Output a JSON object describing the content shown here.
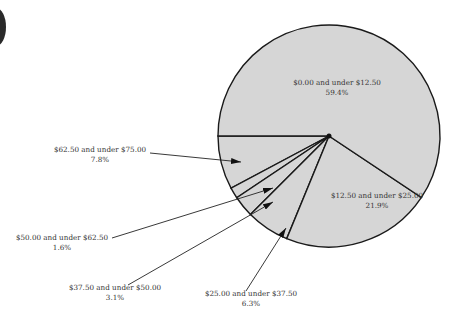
{
  "chart_data": {
    "type": "pie",
    "title": "",
    "start_angle_deg": 180,
    "direction": "counterclockwise-screen-down",
    "center": [
      329,
      136
    ],
    "radius": 111,
    "fill_color": "#d6d6d6",
    "edge_color": "#1a1a1a",
    "slices": [
      {
        "label": "$62.50 and under $75.00",
        "value": 7.8,
        "pct_label": "7.8%",
        "label_pos": [
          100,
          152
        ],
        "leader": [
          [
            150,
            153
          ],
          [
            241,
            162
          ]
        ],
        "inside": false
      },
      {
        "label": "$50.00 and under $62.50",
        "value": 1.6,
        "pct_label": "1.6%",
        "label_pos": [
          62,
          240
        ],
        "leader": [
          [
            112,
            238
          ],
          [
            273,
            188
          ]
        ],
        "inside": false
      },
      {
        "label": "$37.50 and under $50.00",
        "value": 3.1,
        "pct_label": "3.1%",
        "label_pos": [
          115,
          290
        ],
        "leader": [
          [
            128,
            285
          ],
          [
            273,
            202
          ]
        ],
        "inside": false
      },
      {
        "label": "$25.00 and under $37.50",
        "value": 6.3,
        "pct_label": "6.3%",
        "label_pos": [
          251,
          296
        ],
        "leader": [
          [
            246,
            291
          ],
          [
            286,
            228
          ]
        ],
        "inside": false
      },
      {
        "label": "$12.50 and under $25.00",
        "value": 21.9,
        "pct_label": "21.9%",
        "label_pos": [
          377,
          198
        ],
        "leader": null,
        "inside": true
      },
      {
        "label": "$0.00 and under $12.50",
        "value": 59.4,
        "pct_label": "59.4%",
        "label_pos": [
          337,
          85
        ],
        "leader": null,
        "inside": true
      }
    ]
  }
}
